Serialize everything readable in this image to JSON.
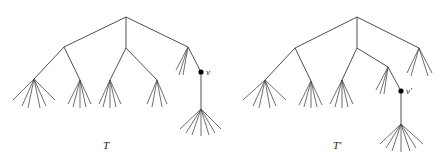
{
  "diagram": {
    "width": 442,
    "height": 164,
    "colors": {
      "edge": "#3a3a3a",
      "leaf": "#4a4a4a",
      "dot": "#000000",
      "text": "#222222"
    },
    "trees": [
      {
        "id": "T",
        "label": "T",
        "label_pos": [
          103,
          149
        ],
        "edges": [
          [
            126,
            17,
            64,
            47
          ],
          [
            126,
            17,
            126,
            48
          ],
          [
            126,
            17,
            188,
            47
          ],
          [
            64,
            47,
            34,
            79
          ],
          [
            64,
            47,
            80,
            80
          ],
          [
            126,
            48,
            110,
            80
          ],
          [
            126,
            48,
            157,
            80
          ],
          [
            188,
            47,
            201,
            72
          ],
          [
            201,
            72,
            201,
            109
          ]
        ],
        "fans": [
          {
            "node": [
              34,
              79
            ],
            "leaves": [
              [
                13,
                100
              ],
              [
                22,
                106
              ],
              [
                28,
                108
              ],
              [
                40,
                108
              ],
              [
                46,
                106
              ],
              [
                55,
                100
              ]
            ]
          },
          {
            "node": [
              80,
              80
            ],
            "leaves": [
              [
                68,
                104
              ],
              [
                73,
                107
              ],
              [
                80,
                108
              ],
              [
                86,
                107
              ],
              [
                91,
                104
              ]
            ]
          },
          {
            "node": [
              110,
              80
            ],
            "leaves": [
              [
                99,
                104
              ],
              [
                103,
                107
              ],
              [
                110,
                108
              ],
              [
                116,
                107
              ],
              [
                121,
                104
              ]
            ]
          },
          {
            "node": [
              157,
              80
            ],
            "leaves": [
              [
                147,
                104
              ],
              [
                152,
                107
              ],
              [
                162,
                107
              ],
              [
                167,
                104
              ]
            ]
          },
          {
            "node": [
              188,
              47
            ],
            "leaves": [
              [
                176,
                70
              ],
              [
                179,
                75
              ],
              [
                183,
                75
              ]
            ]
          },
          {
            "node": [
              201,
              109
            ],
            "leaves": [
              [
                180,
                129
              ],
              [
                186,
                133
              ],
              [
                192,
                135
              ],
              [
                201,
                136
              ],
              [
                209,
                135
              ],
              [
                215,
                133
              ],
              [
                221,
                129
              ]
            ]
          }
        ],
        "marked_nodes": [
          {
            "pos": [
              201,
              72
            ],
            "label": "v",
            "label_pos": [
              206,
              75
            ]
          }
        ]
      },
      {
        "id": "T-prime",
        "label": "T′",
        "label_pos": [
          333,
          149
        ],
        "edges": [
          [
            357,
            17,
            295,
            48
          ],
          [
            357,
            17,
            357,
            48
          ],
          [
            357,
            17,
            419,
            48
          ],
          [
            295,
            48,
            265,
            80
          ],
          [
            295,
            48,
            311,
            81
          ],
          [
            357,
            48,
            342,
            80
          ],
          [
            357,
            48,
            388,
            67
          ],
          [
            388,
            67,
            401,
            91
          ],
          [
            401,
            91,
            401,
            124
          ]
        ],
        "fans": [
          {
            "node": [
              265,
              80
            ],
            "leaves": [
              [
                243,
                100
              ],
              [
                253,
                106
              ],
              [
                259,
                108
              ],
              [
                270,
                108
              ],
              [
                276,
                106
              ],
              [
                286,
                100
              ]
            ]
          },
          {
            "node": [
              311,
              81
            ],
            "leaves": [
              [
                299,
                105
              ],
              [
                304,
                107
              ],
              [
                311,
                108
              ],
              [
                317,
                107
              ],
              [
                322,
                105
              ]
            ]
          },
          {
            "node": [
              342,
              80
            ],
            "leaves": [
              [
                330,
                104
              ],
              [
                335,
                107
              ],
              [
                342,
                108
              ],
              [
                348,
                107
              ],
              [
                353,
                104
              ]
            ]
          },
          {
            "node": [
              388,
              67
            ],
            "leaves": [
              [
                376,
                90
              ],
              [
                380,
                94
              ],
              [
                384,
                94
              ]
            ]
          },
          {
            "node": [
              419,
              48
            ],
            "leaves": [
              [
                407,
                73
              ],
              [
                411,
                76
              ],
              [
                428,
                76
              ],
              [
                432,
                73
              ]
            ]
          },
          {
            "node": [
              401,
              124
            ],
            "leaves": [
              [
                380,
                144
              ],
              [
                386,
                148
              ],
              [
                392,
                151
              ],
              [
                401,
                152
              ],
              [
                410,
                151
              ],
              [
                416,
                148
              ],
              [
                423,
                144
              ]
            ]
          }
        ],
        "marked_nodes": [
          {
            "pos": [
              401,
              91
            ],
            "label": "v′",
            "label_pos": [
              406,
              94
            ]
          }
        ]
      }
    ]
  }
}
